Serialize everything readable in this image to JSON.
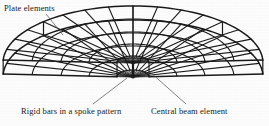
{
  "figure": {
    "type": "finite-element-mesh-diagram",
    "background_color": "#fdfdfd",
    "line_color": "#1a1a1a",
    "text_color": "#1a1a1a"
  },
  "labels": {
    "plate_elements": "Plate elements",
    "rigid_bars": "Rigid bars in a spoke pattern",
    "central_beam": "Central beam element"
  },
  "leaders": {
    "plate_elements": {
      "from": [
        46,
        14
      ],
      "to": [
        63,
        35
      ]
    },
    "rigid_bars": {
      "from": [
        93,
        104
      ],
      "to": [
        127,
        78
      ]
    },
    "central_beam": {
      "from": [
        186,
        104
      ],
      "to": [
        150,
        72
      ]
    }
  },
  "mesh": {
    "hub_top": [
      133,
      63
    ],
    "hub_bottom": [
      133,
      77
    ],
    "radial_divisions": 16,
    "ring_count": 5,
    "slab_thickness_px": 12,
    "ring_radii_x": [
      16,
      44,
      72,
      101,
      130
    ],
    "ring_radii_y": [
      7,
      19,
      31,
      44,
      57
    ],
    "sweep_start_deg": 183,
    "sweep_end_deg": 357
  }
}
